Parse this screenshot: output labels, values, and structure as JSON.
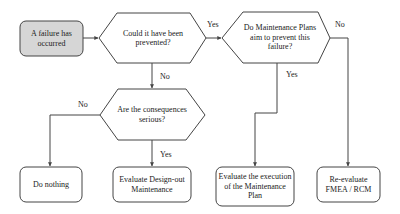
{
  "colors": {
    "stroke": "#444444",
    "start_fill": "#d6d6d6",
    "node_fill": "#ffffff",
    "text": "#222222"
  },
  "nodes": {
    "start": {
      "label": "A failure has occurred",
      "shape": "rounded-rect"
    },
    "q_prevented": {
      "label": "Could it have been prevented?",
      "shape": "hexagon"
    },
    "q_plans": {
      "label": "Do Maintenance Plans aim to prevent this failure?",
      "shape": "hexagon"
    },
    "q_serious": {
      "label": "Are the consequences serious?",
      "shape": "hexagon"
    },
    "do_nothing": {
      "label": "Do nothing",
      "shape": "rounded-rect"
    },
    "design_out": {
      "label": "Evaluate Design-out Maintenance",
      "shape": "rounded-rect"
    },
    "eval_plan": {
      "label": "Evaluate the execution of the Maintenance Plan",
      "shape": "rounded-rect"
    },
    "re_evaluate": {
      "label": "Re-evaluate FMEA / RCM",
      "shape": "rounded-rect"
    }
  },
  "edges": {
    "start_to_prevented": {
      "label": ""
    },
    "prevented_yes": {
      "label": "Yes"
    },
    "prevented_no": {
      "label": "No"
    },
    "plans_yes": {
      "label": "Yes"
    },
    "plans_no": {
      "label": "No"
    },
    "serious_no": {
      "label": "No"
    },
    "serious_yes": {
      "label": "Yes"
    }
  }
}
